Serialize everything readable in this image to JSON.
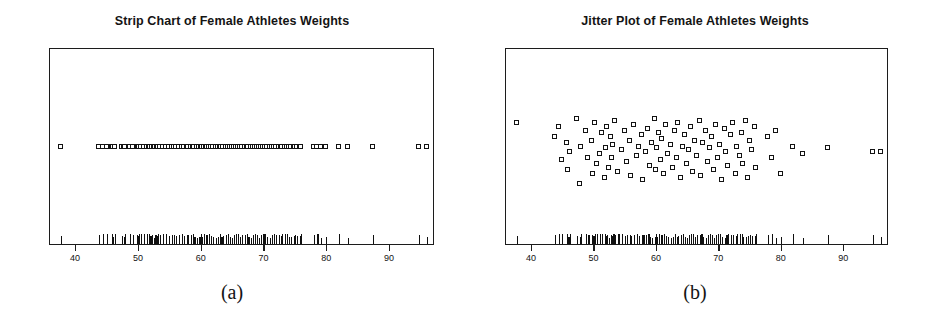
{
  "figure": {
    "background": "#ffffff",
    "ink": "#141414",
    "marker_color": "#ffffff",
    "marker_edge": "#121212"
  },
  "panels": [
    {
      "id": "a",
      "caption": "(a)",
      "title": "Strip Chart of Female Athletes Weights",
      "plot_type": "strip"
    },
    {
      "id": "b",
      "caption": "(b)",
      "title": "Jitter Plot of Female Athletes Weights",
      "plot_type": "jitter"
    }
  ],
  "chart_data": {
    "type": "scatter",
    "subtitle": "",
    "xlabel": "",
    "ylabel": "",
    "xlim": [
      36,
      97
    ],
    "ylim": [
      0,
      1
    ],
    "grid": false,
    "legend": null,
    "xticks": [
      40,
      50,
      60,
      70,
      80,
      90
    ],
    "xticklabels": [
      "40",
      "50",
      "60",
      "70",
      "80",
      "90"
    ],
    "yticks": [],
    "yticklabels": [],
    "n_points": 100,
    "variable": "Weight (kg) of Female Athletes",
    "x": [
      37.8,
      43.8,
      44.5,
      45.0,
      45.8,
      46.0,
      46.3,
      47.4,
      47.8,
      48.0,
      48.8,
      49.2,
      49.8,
      50.0,
      50.2,
      50.5,
      51.0,
      51.4,
      51.8,
      52.0,
      52.2,
      52.5,
      52.8,
      53.0,
      53.2,
      53.5,
      54.0,
      54.5,
      55.0,
      55.4,
      55.8,
      56.0,
      56.5,
      57.0,
      57.3,
      57.8,
      58.0,
      58.4,
      58.8,
      59.0,
      59.4,
      59.8,
      60.0,
      60.2,
      60.5,
      60.8,
      61.0,
      61.3,
      61.6,
      62.0,
      62.4,
      62.8,
      63.0,
      63.3,
      63.6,
      64.0,
      64.3,
      64.6,
      65.0,
      65.3,
      65.6,
      66.0,
      66.3,
      66.6,
      67.0,
      67.3,
      67.6,
      68.0,
      68.3,
      68.6,
      69.0,
      69.3,
      69.6,
      70.0,
      70.3,
      70.6,
      71.0,
      71.3,
      71.6,
      72.0,
      72.4,
      72.8,
      73.0,
      73.4,
      73.8,
      74.0,
      74.4,
      74.8,
      75.0,
      75.4,
      75.8,
      76.0,
      78.0,
      78.6,
      79.2,
      80.0,
      82.0,
      83.5,
      87.5,
      94.8,
      96.0
    ],
    "jitter_y": [
      0.62,
      0.55,
      0.6,
      0.43,
      0.52,
      0.38,
      0.47,
      0.64,
      0.31,
      0.5,
      0.58,
      0.44,
      0.53,
      0.36,
      0.62,
      0.41,
      0.46,
      0.57,
      0.34,
      0.49,
      0.6,
      0.39,
      0.55,
      0.44,
      0.51,
      0.63,
      0.37,
      0.48,
      0.58,
      0.42,
      0.53,
      0.35,
      0.61,
      0.45,
      0.5,
      0.56,
      0.33,
      0.47,
      0.59,
      0.4,
      0.52,
      0.64,
      0.38,
      0.49,
      0.57,
      0.43,
      0.54,
      0.36,
      0.61,
      0.46,
      0.51,
      0.39,
      0.58,
      0.44,
      0.62,
      0.34,
      0.5,
      0.56,
      0.41,
      0.48,
      0.6,
      0.37,
      0.53,
      0.45,
      0.63,
      0.35,
      0.52,
      0.58,
      0.42,
      0.49,
      0.55,
      0.38,
      0.61,
      0.44,
      0.51,
      0.33,
      0.59,
      0.47,
      0.4,
      0.56,
      0.62,
      0.36,
      0.5,
      0.45,
      0.57,
      0.41,
      0.63,
      0.34,
      0.53,
      0.48,
      0.6,
      0.39,
      0.55,
      0.44,
      0.58,
      0.36,
      0.5,
      0.46,
      0.49,
      0.47,
      0.47
    ],
    "rug_values": [
      37.8,
      43.8,
      44.5,
      45.0,
      45.8,
      46.0,
      46.3,
      47.4,
      47.8,
      48.0,
      48.8,
      49.2,
      49.8,
      50.0,
      50.2,
      50.5,
      51.0,
      51.4,
      51.8,
      52.0,
      52.2,
      52.5,
      52.8,
      53.0,
      53.2,
      53.5,
      54.0,
      54.5,
      55.0,
      55.4,
      55.8,
      56.0,
      56.5,
      57.0,
      57.3,
      57.8,
      58.0,
      58.4,
      58.8,
      59.0,
      59.4,
      59.8,
      60.0,
      60.2,
      60.5,
      60.8,
      61.0,
      61.3,
      61.6,
      62.0,
      62.4,
      62.8,
      63.0,
      63.3,
      63.6,
      64.0,
      64.3,
      64.6,
      65.0,
      65.3,
      65.6,
      66.0,
      66.3,
      66.6,
      67.0,
      67.3,
      67.6,
      68.0,
      68.3,
      68.6,
      69.0,
      69.3,
      69.6,
      70.0,
      70.3,
      70.6,
      71.0,
      71.3,
      71.6,
      72.0,
      72.4,
      72.8,
      73.0,
      73.4,
      73.8,
      74.0,
      74.4,
      74.8,
      75.0,
      75.4,
      75.8,
      76.0,
      78.0,
      78.6,
      79.2,
      80.0,
      82.0,
      83.5,
      87.5,
      94.8,
      96.0
    ]
  }
}
